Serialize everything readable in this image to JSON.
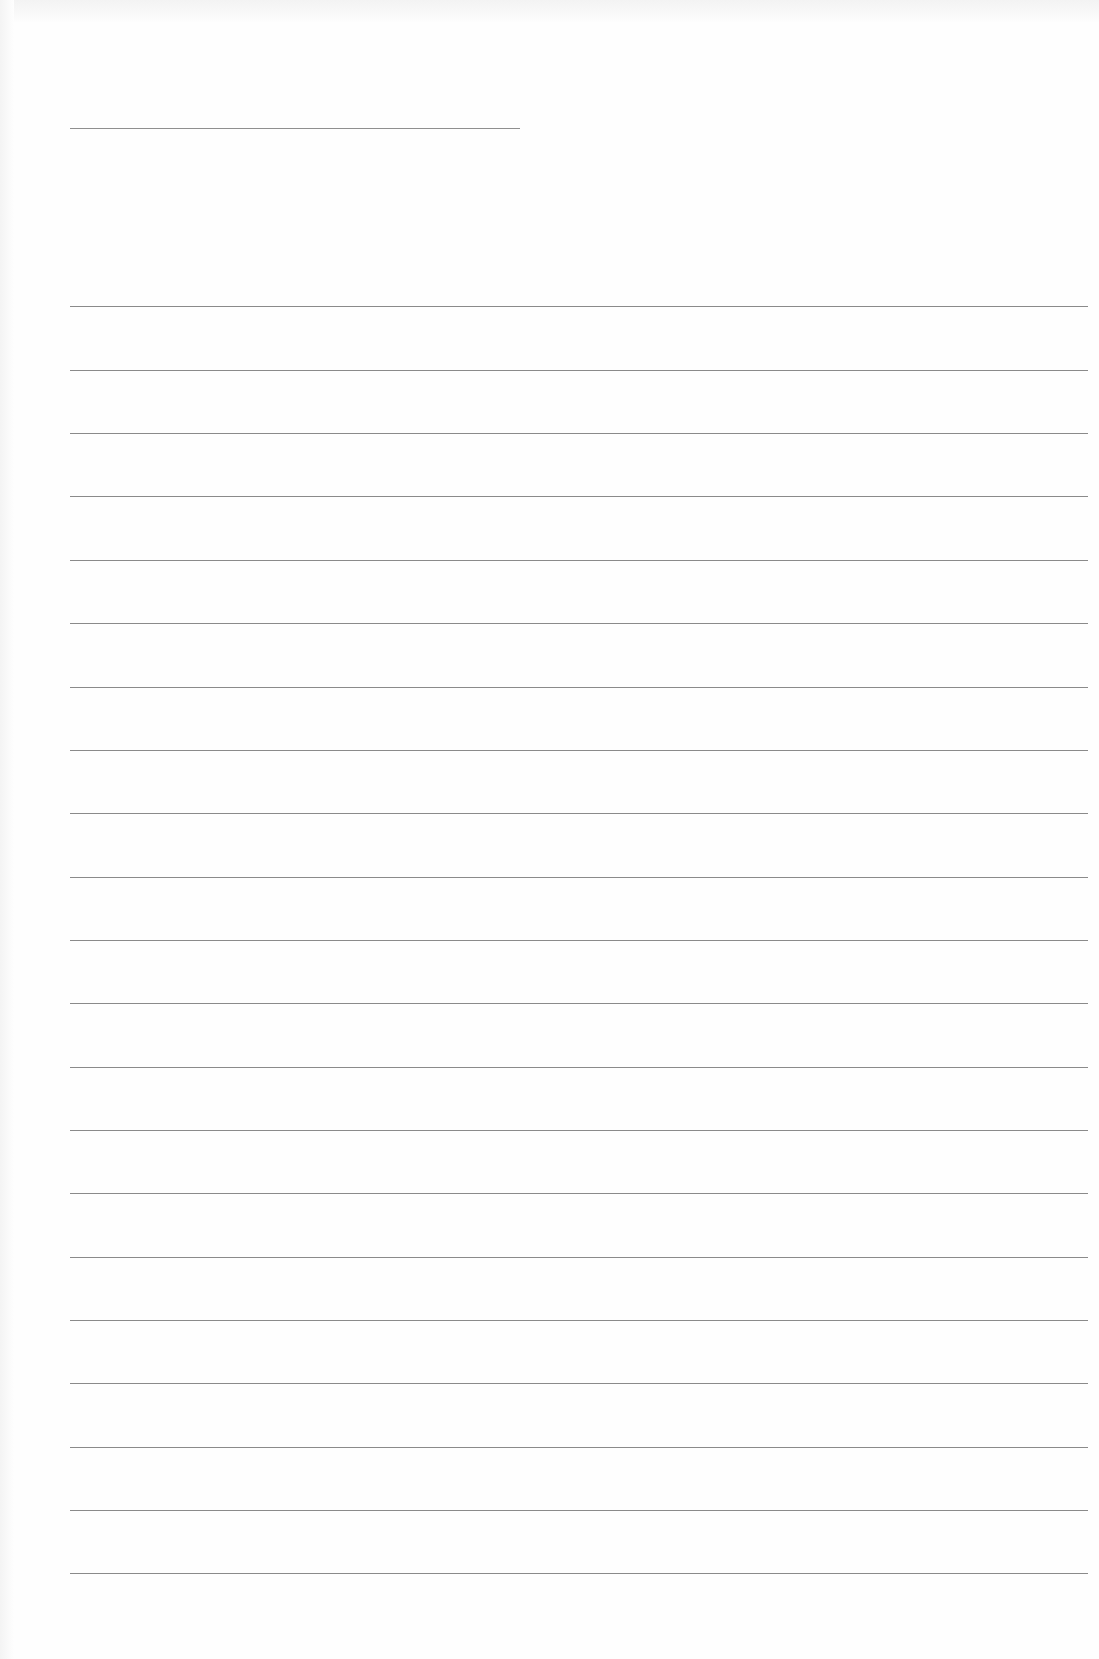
{
  "page": {
    "width": 1099,
    "height": 1659,
    "background": "#fefefe"
  },
  "header_rule": {
    "x": 70,
    "y": 128,
    "width": 450,
    "color": "#8f8f8f"
  },
  "ruled_lines": {
    "x": 70,
    "width": 1018,
    "color": "#8a8a8a",
    "y_positions": [
      306,
      370,
      433,
      496,
      560,
      623,
      687,
      750,
      813,
      877,
      940,
      1003,
      1067,
      1130,
      1193,
      1257,
      1320,
      1383,
      1447,
      1510,
      1573
    ]
  }
}
